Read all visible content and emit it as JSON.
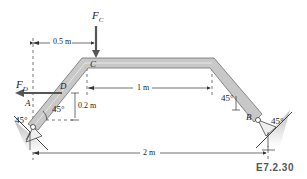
{
  "figure_id": "E7.2.30",
  "forces": {
    "fc": {
      "symbol": "F",
      "sub": "C"
    },
    "fd": {
      "symbol": "F",
      "sub": "D"
    }
  },
  "points": {
    "a": "A",
    "b": "B",
    "c": "C",
    "d": "D"
  },
  "dimensions": {
    "d1": "0.5 m",
    "d2": "1 m",
    "d3": "0.2 m",
    "d4": "2 m"
  },
  "angles": {
    "a_member": "45°",
    "a_support": "45°",
    "b_member": "45°",
    "b_support": "45°"
  },
  "colors": {
    "member_fill": "#c8c8c8",
    "member_stroke": "#6e6e6e",
    "arrow": "#555555",
    "dim_line": "#333333",
    "support": "#b0b0b0"
  }
}
